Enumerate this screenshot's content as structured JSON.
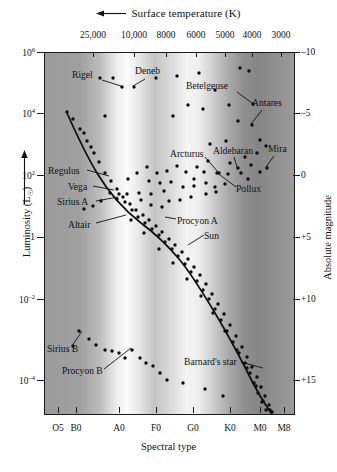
{
  "chart_data": {
    "type": "scatter",
    "title": "",
    "top_axis_label": "Surface temperature (K)",
    "top_axis_arrow": "left-arrow",
    "xlabel": "Spectral type",
    "ylabel": "Luminosity (L☉)",
    "y2label": "Absolute magnitude",
    "grid": false,
    "legend": "none",
    "xlim_spectral": [
      "O5",
      "M8"
    ],
    "ylim_luminosity": [
      1e-05,
      1000000.0
    ],
    "ylim_magnitude": [
      -10,
      17
    ],
    "temperature_ticks": [
      {
        "label": "25,000",
        "x_px": 93
      },
      {
        "label": "10,000",
        "x_px": 134
      },
      {
        "label": "8000",
        "x_px": 166
      },
      {
        "label": "6000",
        "x_px": 196
      },
      {
        "label": "5000",
        "x_px": 225
      },
      {
        "label": "4000",
        "x_px": 252
      },
      {
        "label": "3000",
        "x_px": 281
      }
    ],
    "luminosity_ticks": [
      {
        "label": "10",
        "exp": "6",
        "y_px": 52
      },
      {
        "label": "10",
        "exp": "4",
        "y_px": 113
      },
      {
        "label": "10",
        "exp": "2",
        "y_px": 175
      },
      {
        "label": "1",
        "exp": "",
        "y_px": 237
      },
      {
        "label": "10",
        "exp": "-2",
        "y_px": 299
      },
      {
        "label": "10",
        "exp": "-4",
        "y_px": 380
      }
    ],
    "magnitude_ticks": [
      {
        "label": "–10",
        "y_px": 52
      },
      {
        "label": "–5",
        "y_px": 113
      },
      {
        "label": "0",
        "y_px": 175
      },
      {
        "label": "+5",
        "y_px": 237
      },
      {
        "label": "+10",
        "y_px": 299
      },
      {
        "label": "+15",
        "y_px": 380
      }
    ],
    "spectral_ticks": [
      {
        "label": "O5",
        "x_px": 58
      },
      {
        "label": "B0",
        "x_px": 76
      },
      {
        "label": "A0",
        "x_px": 119
      },
      {
        "label": "F0",
        "x_px": 156
      },
      {
        "label": "G0",
        "x_px": 193
      },
      {
        "label": "K0",
        "x_px": 230
      },
      {
        "label": "M0",
        "x_px": 260
      },
      {
        "label": "M8",
        "x_px": 284
      }
    ],
    "annotations": [
      {
        "name": "Rigel",
        "label_x": 72,
        "label_y": 76,
        "leader": [
          [
            102,
            80
          ],
          [
            121,
            86
          ]
        ]
      },
      {
        "name": "Deneb",
        "label_x": 135,
        "label_y": 72,
        "leader": [
          [
            145,
            79
          ],
          [
            133,
            86
          ]
        ]
      },
      {
        "name": "Betelgeuse",
        "label_x": 186,
        "label_y": 87,
        "leader": [
          [
            237,
            92
          ],
          [
            252,
            103
          ]
        ]
      },
      {
        "name": "Antares",
        "label_x": 252,
        "label_y": 104,
        "leader": [
          [
            262,
            110
          ],
          [
            251,
            124
          ]
        ]
      },
      {
        "name": "Arcturus",
        "label_x": 170,
        "label_y": 155,
        "leader": [
          [
            205,
            157
          ],
          [
            218,
            172
          ]
        ]
      },
      {
        "name": "Aldebaran",
        "label_x": 213,
        "label_y": 152,
        "leader": [
          [
            234,
            157
          ],
          [
            237,
            167
          ]
        ]
      },
      {
        "name": "Mira",
        "label_x": 268,
        "label_y": 150,
        "leader": [
          [
            274,
            156
          ],
          [
            266,
            167
          ]
        ]
      },
      {
        "name": "Pollux",
        "label_x": 236,
        "label_y": 190,
        "leader": [
          [
            236,
            187
          ],
          [
            216,
            172
          ]
        ]
      },
      {
        "name": "Regulus",
        "label_x": 48,
        "label_y": 172,
        "leader": [
          [
            87,
            170
          ],
          [
            109,
            176
          ]
        ]
      },
      {
        "name": "Vega",
        "label_x": 68,
        "label_y": 188,
        "leader": [
          [
            93,
            186
          ],
          [
            114,
            190
          ]
        ]
      },
      {
        "name": "Sirius A",
        "label_x": 57,
        "label_y": 203,
        "leader": [
          [
            96,
            201
          ],
          [
            118,
            197
          ]
        ]
      },
      {
        "name": "Altair",
        "label_x": 68,
        "label_y": 226,
        "leader": [
          [
            96,
            223
          ],
          [
            126,
            215
          ]
        ]
      },
      {
        "name": "Procyon A",
        "label_x": 177,
        "label_y": 222,
        "leader": [
          [
            176,
            219
          ],
          [
            165,
            217
          ]
        ]
      },
      {
        "name": "Sun",
        "label_x": 204,
        "label_y": 237,
        "leader": [
          [
            204,
            235
          ],
          [
            188,
            245
          ]
        ]
      },
      {
        "name": "Sirius B",
        "label_x": 47,
        "label_y": 350,
        "leader": [
          [
            72,
            346
          ],
          [
            82,
            331
          ]
        ]
      },
      {
        "name": "Procyon B",
        "label_x": 62,
        "label_y": 372,
        "leader": [
          [
            104,
            369
          ],
          [
            131,
            348
          ]
        ]
      },
      {
        "name": "Barnard's star",
        "label_x": 184,
        "label_y": 363,
        "leader": [
          [
            241,
            362
          ],
          [
            263,
            368
          ]
        ]
      }
    ],
    "main_sequence_path": "M 66,112 C 74,130 84,152 96,172 C 108,192 122,208 140,222 C 156,234 168,246 178,258 C 190,272 202,292 214,312 C 226,332 240,358 252,382 C 260,398 266,406 270,412",
    "giant_branch_points": [
      [
        99,
        77
      ],
      [
        112,
        77
      ],
      [
        133,
        86
      ],
      [
        121,
        86
      ],
      [
        155,
        77
      ],
      [
        176,
        75
      ],
      [
        198,
        72
      ],
      [
        214,
        89
      ],
      [
        187,
        104
      ],
      [
        248,
        70
      ],
      [
        228,
        104
      ],
      [
        239,
        67
      ],
      [
        104,
        115
      ],
      [
        172,
        115
      ],
      [
        237,
        120
      ],
      [
        202,
        108
      ],
      [
        251,
        124
      ],
      [
        252,
        103
      ],
      [
        225,
        140
      ],
      [
        209,
        143
      ],
      [
        259,
        139
      ],
      [
        244,
        156
      ],
      [
        265,
        145
      ],
      [
        266,
        167
      ],
      [
        237,
        167
      ],
      [
        250,
        164
      ],
      [
        256,
        152
      ],
      [
        229,
        162
      ],
      [
        218,
        172
      ],
      [
        207,
        160
      ],
      [
        196,
        166
      ],
      [
        216,
        172
      ],
      [
        227,
        173
      ],
      [
        240,
        172
      ],
      [
        259,
        171
      ],
      [
        247,
        178
      ],
      [
        203,
        171
      ],
      [
        193,
        178
      ],
      [
        185,
        171
      ],
      [
        176,
        165
      ],
      [
        166,
        170
      ],
      [
        156,
        172
      ],
      [
        146,
        166
      ],
      [
        136,
        172
      ],
      [
        127,
        178
      ],
      [
        148,
        180
      ],
      [
        159,
        182
      ],
      [
        170,
        181
      ],
      [
        182,
        186
      ],
      [
        193,
        185
      ],
      [
        205,
        182
      ],
      [
        214,
        186
      ],
      [
        224,
        183
      ],
      [
        205,
        193
      ],
      [
        215,
        191
      ],
      [
        163,
        190
      ],
      [
        150,
        193
      ],
      [
        138,
        192
      ],
      [
        126,
        193
      ],
      [
        116,
        198
      ],
      [
        109,
        192
      ],
      [
        100,
        200
      ],
      [
        92,
        205
      ],
      [
        83,
        208
      ],
      [
        168,
        200
      ],
      [
        179,
        199
      ],
      [
        190,
        196
      ],
      [
        150,
        204
      ],
      [
        161,
        206
      ],
      [
        140,
        199
      ]
    ],
    "main_sequence_points": [
      [
        66,
        111
      ],
      [
        72,
        118
      ],
      [
        79,
        128
      ],
      [
        86,
        140
      ],
      [
        93,
        152
      ],
      [
        83,
        132
      ],
      [
        90,
        146
      ],
      [
        98,
        161
      ],
      [
        104,
        172
      ],
      [
        110,
        180
      ],
      [
        116,
        188
      ],
      [
        122,
        196
      ],
      [
        129,
        203
      ],
      [
        135,
        209
      ],
      [
        142,
        214
      ],
      [
        148,
        219
      ],
      [
        155,
        225
      ],
      [
        161,
        231
      ],
      [
        168,
        238
      ],
      [
        174,
        244
      ],
      [
        181,
        251
      ],
      [
        187,
        258
      ],
      [
        193,
        266
      ],
      [
        199,
        274
      ],
      [
        205,
        283
      ],
      [
        211,
        293
      ],
      [
        217,
        303
      ],
      [
        223,
        313
      ],
      [
        229,
        324
      ],
      [
        235,
        335
      ],
      [
        241,
        346
      ],
      [
        246,
        356
      ],
      [
        251,
        366
      ],
      [
        256,
        376
      ],
      [
        260,
        386
      ],
      [
        264,
        395
      ],
      [
        268,
        404
      ],
      [
        271,
        411
      ],
      [
        118,
        193
      ],
      [
        124,
        201
      ],
      [
        131,
        209
      ],
      [
        137,
        216
      ],
      [
        144,
        222
      ],
      [
        151,
        228
      ],
      [
        158,
        234
      ],
      [
        164,
        241
      ],
      [
        171,
        248
      ],
      [
        177,
        255
      ],
      [
        184,
        263
      ],
      [
        190,
        271
      ],
      [
        196,
        280
      ],
      [
        202,
        289
      ],
      [
        208,
        298
      ],
      [
        214,
        308
      ],
      [
        220,
        319
      ],
      [
        226,
        330
      ],
      [
        232,
        341
      ],
      [
        238,
        352
      ],
      [
        244,
        362
      ],
      [
        249,
        372
      ],
      [
        253,
        382
      ],
      [
        257,
        392
      ],
      [
        261,
        401
      ],
      [
        265,
        409
      ],
      [
        130,
        219
      ],
      [
        143,
        232
      ],
      [
        158,
        248
      ],
      [
        172,
        262
      ],
      [
        186,
        278
      ],
      [
        200,
        295
      ],
      [
        212,
        312
      ],
      [
        224,
        330
      ],
      [
        236,
        349
      ],
      [
        246,
        367
      ],
      [
        255,
        385
      ],
      [
        262,
        400
      ],
      [
        269,
        409
      ]
    ],
    "white_dwarf_points": [
      [
        78,
        330
      ],
      [
        72,
        345
      ],
      [
        88,
        338
      ],
      [
        95,
        344
      ],
      [
        104,
        349
      ],
      [
        111,
        350
      ],
      [
        118,
        352
      ],
      [
        124,
        357
      ],
      [
        131,
        349
      ],
      [
        139,
        357
      ],
      [
        145,
        362
      ],
      [
        152,
        365
      ],
      [
        159,
        372
      ],
      [
        166,
        379
      ],
      [
        182,
        382
      ],
      [
        204,
        388
      ],
      [
        222,
        395
      ]
    ]
  },
  "axes": {
    "top_label": "Surface temperature (K)",
    "left_label_prefix": "Luminosity (L",
    "left_label_suffix": ")",
    "left_label_sub": "☉",
    "right_label": "Absolute magnitude",
    "bottom_label": "Spectral type"
  },
  "icons": {
    "left_arrow": "left-arrow-icon",
    "up_arrow": "up-arrow-icon"
  }
}
